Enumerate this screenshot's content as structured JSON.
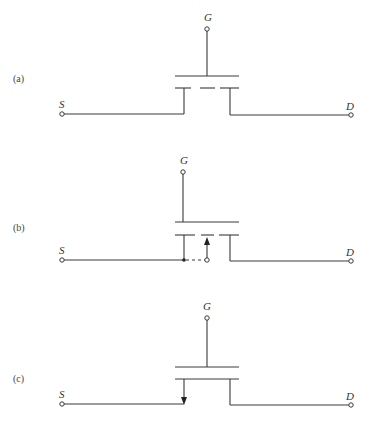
{
  "figure": {
    "panels": [
      {
        "id": "a",
        "label": "(a)",
        "gate": "G",
        "source": "S",
        "drain": "D",
        "channel": "dashed (three segments)",
        "substrate_arrow": "none"
      },
      {
        "id": "b",
        "label": "(b)",
        "gate": "G",
        "source": "S",
        "drain": "D",
        "channel": "dashed (three segments)",
        "substrate_arrow": "up, body terminal with dashed connection to source"
      },
      {
        "id": "c",
        "label": "(c)",
        "gate": "G",
        "source": "S",
        "drain": "D",
        "channel": "solid",
        "substrate_arrow": "down on source lead"
      }
    ],
    "colors": {
      "line": "#3a3a3a",
      "background": "#ffffff"
    }
  }
}
